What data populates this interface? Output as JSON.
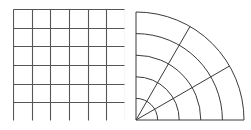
{
  "figure": {
    "title": "",
    "background_color": "#ffffff",
    "width": 251,
    "height": 130,
    "panel_count": 2
  },
  "chart_data": [
    {
      "type": "grid",
      "name": "cartesian-grid",
      "title": "",
      "subtitle": "",
      "xlabel": "",
      "ylabel": "",
      "grid": true,
      "legend": false,
      "coordinate_system": "cartesian",
      "columns": 6,
      "rows": 6,
      "cell_count": 36,
      "x_ticks": [
        0,
        1,
        2,
        3,
        4,
        5,
        6
      ],
      "y_ticks": [
        0,
        1,
        2,
        3,
        4,
        5,
        6
      ],
      "xlim": [
        0,
        6
      ],
      "ylim": [
        0,
        6
      ],
      "tick_labels_visible": false,
      "line_color": "#555555",
      "line_width": 1.1,
      "fill_color": "#ffffff",
      "bounds": {
        "x": 13,
        "y": 9,
        "width": 112,
        "height": 112
      }
    },
    {
      "type": "grid",
      "name": "polar-grid",
      "title": "",
      "subtitle": "",
      "xlabel": "",
      "ylabel": "",
      "grid": true,
      "legend": false,
      "coordinate_system": "polar",
      "quadrant": "upper-left",
      "origin": {
        "x": 136,
        "y": 118
      },
      "radius_max": 108,
      "radial_rings": [
        21.6,
        43.2,
        64.8,
        86.4,
        108
      ],
      "ring_count": 5,
      "radial_tick_values": [
        1,
        2,
        3,
        4,
        5
      ],
      "angular_spokes_degrees": [
        0,
        30,
        60,
        90
      ],
      "spoke_count": 4,
      "angle_range_degrees": [
        0,
        90
      ],
      "tick_labels_visible": false,
      "line_color": "#3a3a3a",
      "line_width": 1.0,
      "fill_color": "#ffffff",
      "bounds": {
        "x": 133,
        "y": 9,
        "width": 112,
        "height": 112
      }
    }
  ],
  "colors": {
    "cartesian_line": "#555555",
    "polar_line": "#3a3a3a",
    "background": "#ffffff",
    "fill": "#ffffff"
  }
}
